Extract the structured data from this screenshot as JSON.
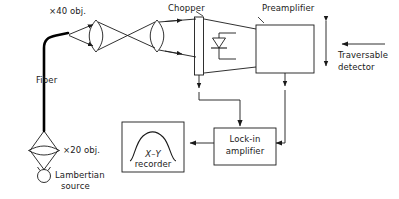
{
  "diagram": {
    "type": "optical-block-diagram",
    "stroke_color": "#1a1a1a",
    "fiber_color": "#000000",
    "background": "#ffffff"
  },
  "labels": {
    "obj40": "×40 obj.",
    "obj20": "×20 obj.",
    "fiber": "Fiber",
    "lambertian_line1": "Lambertian",
    "lambertian_line2": "source",
    "chopper": "Chopper",
    "preamplifier": "Preamplifier",
    "traversable_line1": "Traversable",
    "traversable_line2": "detector",
    "recorder_line1": "X–Y",
    "recorder_line2": "recorder",
    "lockin_line1": "Lock-in",
    "lockin_line2": "amplifier"
  },
  "components": [
    {
      "name": "lambertian-source",
      "kind": "circle-source"
    },
    {
      "name": "objective-20x",
      "kind": "lens"
    },
    {
      "name": "optical-fiber",
      "kind": "fiber-cable"
    },
    {
      "name": "objective-40x",
      "kind": "lens"
    },
    {
      "name": "collimating-lens",
      "kind": "lens"
    },
    {
      "name": "chopper",
      "kind": "rectangle"
    },
    {
      "name": "photodiode",
      "kind": "diode"
    },
    {
      "name": "preamplifier",
      "kind": "box"
    },
    {
      "name": "lock-in-amplifier",
      "kind": "box"
    },
    {
      "name": "xy-recorder",
      "kind": "box-with-curve"
    }
  ],
  "signal_paths": [
    {
      "name": "chopper-reference-to-lockin",
      "from": "chopper",
      "to": "lock-in-amplifier"
    },
    {
      "name": "preamp-output-to-lockin",
      "from": "preamplifier",
      "to": "lock-in-amplifier"
    },
    {
      "name": "lockin-output-to-recorder",
      "from": "lock-in-amplifier",
      "to": "xy-recorder"
    }
  ]
}
